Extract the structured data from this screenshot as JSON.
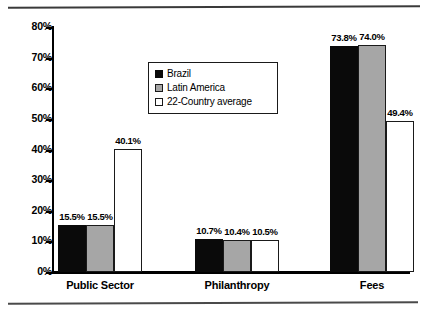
{
  "chart_data": {
    "type": "bar",
    "title": "",
    "subtitle": "",
    "xlabel": "",
    "ylabel": "",
    "categories": [
      "Public Sector",
      "Philanthropy",
      "Fees"
    ],
    "series": [
      {
        "name": "Brazil",
        "color": "#0a0a0a",
        "values": [
          15.5,
          10.7,
          73.8
        ],
        "labels": [
          "15.5%",
          "10.7%",
          "73.8%"
        ]
      },
      {
        "name": "Latin America",
        "color": "#a6a6a6",
        "values": [
          15.5,
          10.4,
          74.0
        ],
        "labels": [
          "15.5%",
          "10.4%",
          "74.0%"
        ]
      },
      {
        "name": "22-Country average",
        "color": "#ffffff",
        "values": [
          40.1,
          10.5,
          49.4
        ],
        "labels": [
          "40.1%",
          "10.5%",
          "49.4%"
        ]
      }
    ],
    "ylim": [
      0,
      80
    ],
    "ytick_values": [
      0,
      10,
      20,
      30,
      40,
      50,
      60,
      70,
      80
    ],
    "ytick_labels": [
      "0%",
      "10%",
      "20%",
      "30%",
      "40%",
      "50%",
      "60%",
      "70%",
      "80%"
    ],
    "grid": false,
    "legend_position": "upper-center-left",
    "value_labels_shown": true,
    "units": "percent"
  },
  "legend": {
    "items": [
      {
        "label": "Brazil",
        "swatch": "black-square-icon"
      },
      {
        "label": "Latin America",
        "swatch": "gray-square-icon"
      },
      {
        "label": "22-Country average",
        "swatch": "white-square-icon"
      }
    ]
  }
}
